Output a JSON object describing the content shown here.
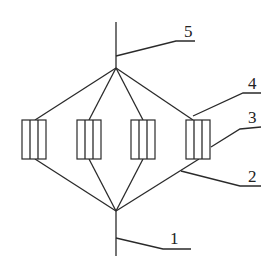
{
  "diagram": {
    "labels": [
      {
        "id": "1",
        "text": "1"
      },
      {
        "id": "2",
        "text": "2"
      },
      {
        "id": "3",
        "text": "3"
      },
      {
        "id": "4",
        "text": "4"
      },
      {
        "id": "5",
        "text": "5"
      }
    ],
    "components": [
      {
        "name": "component-1",
        "cells": 3
      },
      {
        "name": "component-2",
        "cells": 3
      },
      {
        "name": "component-3",
        "cells": 3
      },
      {
        "name": "component-4",
        "cells": 3
      }
    ],
    "colors": {
      "line": "#2a2a2a",
      "background": "#ffffff"
    }
  }
}
